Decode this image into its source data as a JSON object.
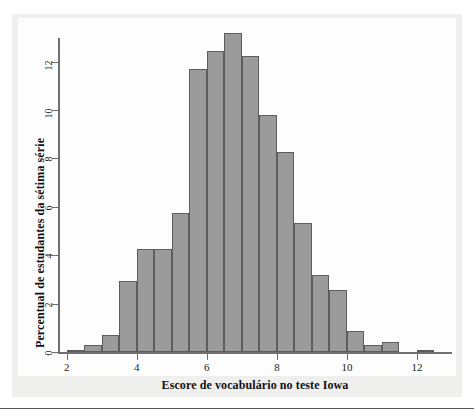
{
  "figure": {
    "background_color": "#efefee",
    "panel_color": "#fdfdfd",
    "bar_fill": "#9b9b9b",
    "bar_stroke": "#5d5d5d",
    "axis_color": "#6f6f6f"
  },
  "chart_data": {
    "type": "bar",
    "title": "",
    "subtitle": "",
    "xlabel": "Escore de vocabulário no teste Iowa",
    "ylabel": "Percentual de estudantes da sétima série",
    "xlim": [
      1.75,
      13.0
    ],
    "ylim": [
      0,
      13.6
    ],
    "grid": false,
    "legend": null,
    "bin_width": 0.5,
    "x_ticks": [
      2,
      4,
      6,
      8,
      10,
      12
    ],
    "x_tick_labels": [
      "2",
      "4",
      "6",
      "8",
      "10",
      "12"
    ],
    "y_ticks": [
      0,
      2,
      4,
      6,
      8,
      10,
      12
    ],
    "y_tick_labels": [
      "0",
      "2",
      "4",
      "6",
      "8",
      "10",
      "12"
    ],
    "bin_starts": [
      2.0,
      2.5,
      3.0,
      3.5,
      4.0,
      4.5,
      5.0,
      5.5,
      6.0,
      6.5,
      7.0,
      7.5,
      8.0,
      8.5,
      9.0,
      9.5,
      10.0,
      10.5,
      11.0,
      11.5,
      12.0
    ],
    "categories": [
      "2.0-2.5",
      "2.5-3.0",
      "3.0-3.5",
      "3.5-4.0",
      "4.0-4.5",
      "4.5-5.0",
      "5.0-5.5",
      "5.5-6.0",
      "6.0-6.5",
      "6.5-7.0",
      "7.0-7.5",
      "7.5-8.0",
      "8.0-8.5",
      "8.5-9.0",
      "9.0-9.5",
      "9.5-10.0",
      "10.0-10.5",
      "10.5-11.0",
      "11.0-11.5",
      "11.5-12.0",
      "12.0-12.5"
    ],
    "values": [
      0.1,
      0.3,
      0.7,
      2.95,
      4.25,
      4.25,
      5.75,
      11.7,
      12.45,
      13.2,
      12.25,
      9.8,
      8.25,
      5.35,
      3.2,
      2.55,
      0.85,
      0.3,
      0.4,
      0.0,
      0.1
    ]
  }
}
